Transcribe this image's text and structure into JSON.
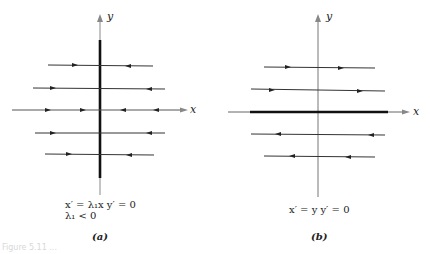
{
  "panels": [
    {
      "id": "a",
      "sublabel": "(a)",
      "axis_labels": {
        "x": "x",
        "y": "y"
      },
      "equation_line1": "x′ = λ₁x    y′ = 0",
      "equation_line2": "λ₁ < 0",
      "description": "y-axis is a line of equilibria (thick); horizontal trajectories flow toward the y-axis"
    },
    {
      "id": "b",
      "sublabel": "(b)",
      "axis_labels": {
        "x": "x",
        "y": "y"
      },
      "equation_line1": "x′ = y    y′ = 0",
      "description": "x-axis is a line of equilibria (thick); trajectories above flow right, below flow left"
    }
  ],
  "caption": "Figure 5.11 ..."
}
